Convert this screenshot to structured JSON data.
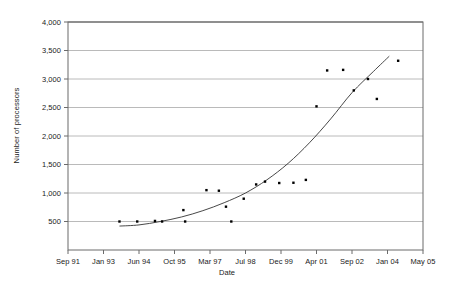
{
  "chart_data": {
    "type": "scatter",
    "title": "",
    "xlabel": "Date",
    "ylabel": "Number of processors",
    "grid": true,
    "legend": false,
    "ylim": [
      0,
      4000
    ],
    "ytick_values": [
      500,
      1000,
      1500,
      2000,
      2500,
      3000,
      3500,
      4000
    ],
    "ytick_labels": [
      "500",
      "1,000",
      "1,500",
      "2,000",
      "2,500",
      "3,000",
      "3,500",
      "4,000"
    ],
    "xtick_labels": [
      "Sep 91",
      "Jan 93",
      "Jun 94",
      "Oct 95",
      "Mar 97",
      "Jul 98",
      "Dec 99",
      "Apr 01",
      "Sep 02",
      "Jan 04",
      "May 05"
    ],
    "xlim_index": [
      0,
      10
    ],
    "series": [
      {
        "name": "Number of processors",
        "marker": "dot",
        "color": "#000000",
        "points": [
          {
            "x": 1.45,
            "y": 500
          },
          {
            "x": 1.95,
            "y": 500
          },
          {
            "x": 2.45,
            "y": 510
          },
          {
            "x": 2.65,
            "y": 500
          },
          {
            "x": 3.25,
            "y": 700
          },
          {
            "x": 3.3,
            "y": 500
          },
          {
            "x": 3.9,
            "y": 1050
          },
          {
            "x": 4.25,
            "y": 1040
          },
          {
            "x": 4.45,
            "y": 760
          },
          {
            "x": 4.6,
            "y": 500
          },
          {
            "x": 4.95,
            "y": 900
          },
          {
            "x": 5.3,
            "y": 1150
          },
          {
            "x": 5.55,
            "y": 1200
          },
          {
            "x": 5.95,
            "y": 1175
          },
          {
            "x": 6.35,
            "y": 1180
          },
          {
            "x": 6.7,
            "y": 1230
          },
          {
            "x": 7.0,
            "y": 2520
          },
          {
            "x": 7.3,
            "y": 3150
          },
          {
            "x": 7.75,
            "y": 3160
          },
          {
            "x": 8.05,
            "y": 2800
          },
          {
            "x": 8.45,
            "y": 3000
          },
          {
            "x": 8.7,
            "y": 2650
          },
          {
            "x": 9.3,
            "y": 3320
          }
        ]
      }
    ],
    "trendline": {
      "name": "exponential trend",
      "color": "#333333",
      "points": [
        {
          "x": 1.45,
          "y": 420
        },
        {
          "x": 2.0,
          "y": 440
        },
        {
          "x": 2.6,
          "y": 500
        },
        {
          "x": 3.2,
          "y": 580
        },
        {
          "x": 3.8,
          "y": 690
        },
        {
          "x": 4.4,
          "y": 830
        },
        {
          "x": 5.0,
          "y": 1000
        },
        {
          "x": 5.6,
          "y": 1230
        },
        {
          "x": 6.2,
          "y": 1520
        },
        {
          "x": 6.8,
          "y": 1880
        },
        {
          "x": 7.4,
          "y": 2300
        },
        {
          "x": 8.0,
          "y": 2760
        },
        {
          "x": 8.6,
          "y": 3130
        },
        {
          "x": 9.05,
          "y": 3400
        }
      ]
    }
  }
}
